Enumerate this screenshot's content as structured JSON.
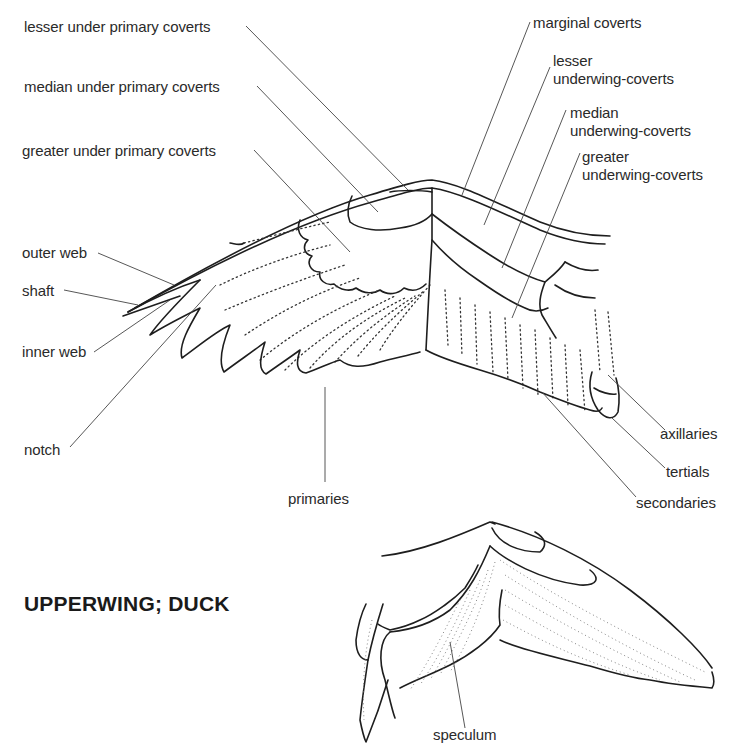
{
  "figure": {
    "underwing": {
      "labels": {
        "lesser_under_primary_coverts": "lesser under primary coverts",
        "median_under_primary_coverts": "median under primary coverts",
        "greater_under_primary_coverts": "greater under primary coverts",
        "outer_web": "outer web",
        "shaft": "shaft",
        "inner_web": "inner web",
        "notch": "notch",
        "primaries": "primaries",
        "marginal_coverts": "marginal coverts",
        "lesser_underwing_coverts_1": "lesser",
        "lesser_underwing_coverts_2": "underwing-coverts",
        "median_underwing_coverts_1": "median",
        "median_underwing_coverts_2": "underwing-coverts",
        "greater_underwing_coverts_1": "greater",
        "greater_underwing_coverts_2": "underwing-coverts",
        "axillaries": "axillaries",
        "tertials": "tertials",
        "secondaries": "secondaries"
      }
    },
    "upperwing": {
      "title": "UPPERWING; DUCK",
      "labels": {
        "speculum": "speculum"
      }
    }
  }
}
